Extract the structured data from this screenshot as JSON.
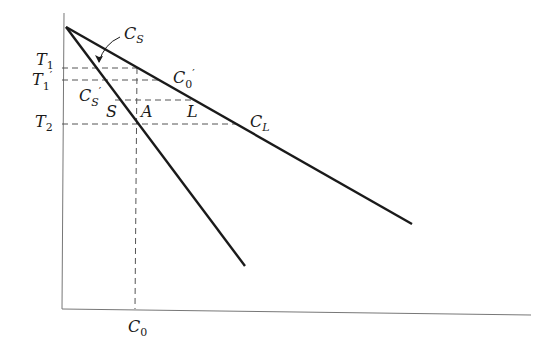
{
  "diagram": {
    "type": "phase-diagram-segment",
    "colors": {
      "line": "#1a1a1a",
      "dashed": "#555555",
      "axis": "#777777",
      "background": "#ffffff"
    },
    "axes": {
      "origin": [
        62,
        309
      ],
      "y_top": [
        64,
        13
      ],
      "x_end": [
        531,
        315
      ]
    },
    "lines": {
      "liquidus": {
        "name": "liquidus",
        "from": [
          66,
          27
        ],
        "to": [
          412,
          224
        ]
      },
      "solidus": {
        "name": "solidus",
        "from": [
          66,
          27
        ],
        "to": [
          245,
          266
        ]
      }
    },
    "dashed": [
      {
        "name": "T1-isotherm",
        "from": [
          62,
          68
        ],
        "to": [
          138,
          68
        ]
      },
      {
        "name": "T1prime-isotherm",
        "from": [
          62,
          80
        ],
        "to": [
          160,
          80
        ]
      },
      {
        "name": "intermediate-isotherm",
        "from": [
          115,
          100
        ],
        "to": [
          194,
          100
        ]
      },
      {
        "name": "T2-isotherm",
        "from": [
          62,
          124
        ],
        "to": [
          237,
          124
        ]
      },
      {
        "name": "C0-composition",
        "from": [
          137,
          68
        ],
        "to": [
          135,
          309
        ]
      }
    ],
    "arrow": {
      "name": "Cs-pointer",
      "from": [
        118,
        38
      ],
      "to": [
        98,
        62
      ]
    },
    "labels": {
      "T1": {
        "main": "T",
        "sub": "1",
        "sup": ""
      },
      "T1prime": {
        "main": "T",
        "sub": "1",
        "sup": "′"
      },
      "T2": {
        "main": "T",
        "sub": "2",
        "sup": ""
      },
      "Cs": {
        "main": "C",
        "sub": "S",
        "sup": ""
      },
      "Csprime": {
        "main": "C",
        "sub": "S",
        "sup": "′"
      },
      "C0prime": {
        "main": "C",
        "sub": "0",
        "sup": "′"
      },
      "CL": {
        "main": "C",
        "sub": "L",
        "sup": ""
      },
      "C0": {
        "main": "C",
        "sub": "0",
        "sup": ""
      },
      "S": {
        "main": "S"
      },
      "A": {
        "main": "A"
      },
      "L": {
        "main": "L"
      }
    }
  }
}
